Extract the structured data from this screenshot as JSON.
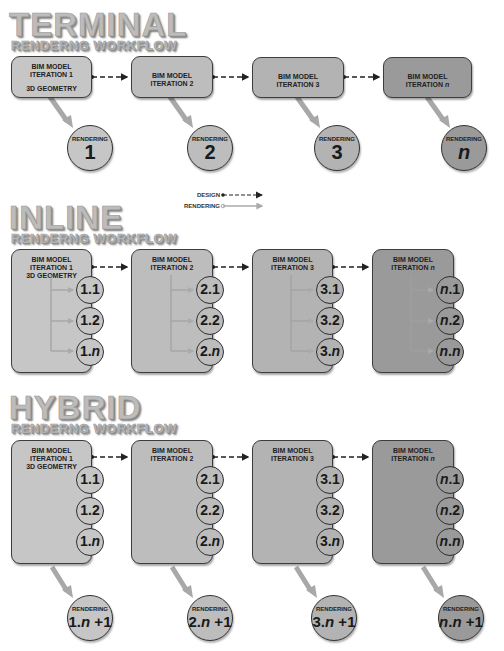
{
  "sections": [
    {
      "title": "TERMINAL",
      "subtitle": "RENDERNG WORKFLOW"
    },
    {
      "title": "INLINE",
      "subtitle": "RENDERNG WORKFLOW"
    },
    {
      "title": "HYBRID",
      "subtitle": "RENDERNG WORKFLOW"
    }
  ],
  "iterations": [
    {
      "line1": "BIM MODEL",
      "line2": "ITERATION 1",
      "geometry": "3D GEOMETRY"
    },
    {
      "line1": "BIM MODEL",
      "line2": "ITERATION 2"
    },
    {
      "line1": "BIM MODEL",
      "line2": "ITERATION 3"
    },
    {
      "line1": "BIM MODEL",
      "line2": "ITERATION n"
    }
  ],
  "terminal_renderings": [
    {
      "label": "RENDERING",
      "value": "1"
    },
    {
      "label": "RENDERING",
      "value": "2"
    },
    {
      "label": "RENDERING",
      "value": "3"
    },
    {
      "label": "RENDERING",
      "value": "n"
    }
  ],
  "sub_renderings": [
    [
      "1.1",
      "1.2",
      "1.n"
    ],
    [
      "2.1",
      "2.2",
      "2.n"
    ],
    [
      "3.1",
      "3.2",
      "3.n"
    ],
    [
      "n.1",
      "n.2",
      "n.n"
    ]
  ],
  "hybrid_renderings": [
    {
      "label": "RENDERING",
      "value": "1.n +1"
    },
    {
      "label": "RENDERING",
      "value": "2.n +1"
    },
    {
      "label": "RENDERING",
      "value": "3.n +1"
    },
    {
      "label": "RENDERING",
      "value": "n.n +1"
    }
  ],
  "legend": {
    "design": "DESIGN",
    "rendering": "RENDERING"
  },
  "colors": {
    "iter1": "#c6c6c6",
    "iter2": "#bdbdbd",
    "iter3": "#b3b3b3",
    "itern": "#9a9a9a",
    "render_arrow": "#a8a8a8",
    "design_line": "#222222"
  }
}
